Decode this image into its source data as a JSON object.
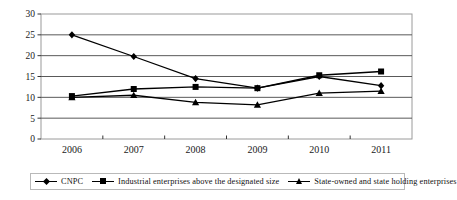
{
  "chart_data": {
    "type": "line",
    "title": "",
    "subtitle": "",
    "xlabel": "",
    "ylabel": "",
    "categories": [
      "2006",
      "2007",
      "2008",
      "2009",
      "2010",
      "2011"
    ],
    "ylim": [
      0,
      30
    ],
    "yticks": [
      0,
      5,
      10,
      15,
      20,
      25,
      30
    ],
    "grid": true,
    "legend_position": "bottom",
    "series": [
      {
        "name": "CNPC",
        "marker": "diamond",
        "values": [
          25.0,
          19.8,
          14.5,
          12.2,
          15.0,
          12.8
        ]
      },
      {
        "name": "Industrial enterprises above the designated size",
        "marker": "square",
        "values": [
          10.3,
          12.0,
          12.5,
          12.2,
          15.3,
          16.2
        ]
      },
      {
        "name": "State-owned and state holding enterprises",
        "marker": "triangle",
        "values": [
          10.0,
          10.5,
          8.8,
          8.2,
          11.0,
          11.5
        ]
      }
    ]
  },
  "colors": {
    "line": "#000000",
    "grid": "#595959",
    "frame": "#9a9a9a",
    "legend_border": "#b9b9b9",
    "text": "#111111"
  },
  "legend": {
    "items": [
      {
        "label": "CNPC",
        "marker": "diamond-marker"
      },
      {
        "label": "Industrial enterprises above the designated size",
        "marker": "square-marker"
      },
      {
        "label": "State-owned and state holding enterprises",
        "marker": "triangle-marker"
      }
    ]
  }
}
